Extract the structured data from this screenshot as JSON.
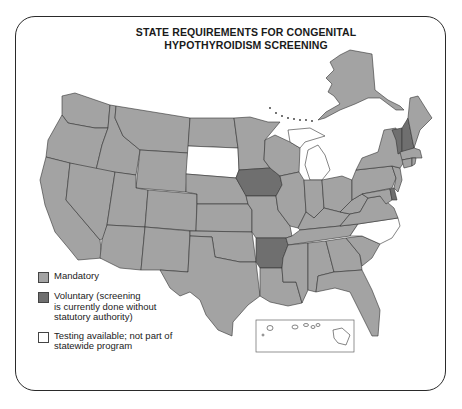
{
  "title": {
    "line1": "STATE REQUIREMENTS FOR CONGENITAL",
    "line2": "HYPOTHYROIDISM SCREENING"
  },
  "colors": {
    "mandatory": "#a3a3a3",
    "voluntary": "#6f6f6f",
    "testing_available": "#ffffff",
    "border": "#2a2a2a"
  },
  "legend": {
    "items": [
      {
        "key": "mandatory",
        "label": "Mandatory"
      },
      {
        "key": "voluntary",
        "label": "Voluntary (screening\nis currently done without\nstatutory authority)"
      },
      {
        "key": "testing_available",
        "label": "Testing available; not part of\nstatewide program"
      }
    ]
  },
  "states": {
    "voluntary": [
      "Iowa",
      "Arkansas",
      "Vermont",
      "New Hampshire",
      "Delaware"
    ],
    "testing_available": [
      "South Dakota",
      "Michigan",
      "North Carolina",
      "Hawaii"
    ],
    "mandatory": "all other states including Alaska"
  },
  "insets": {
    "alaska": "upper right",
    "hawaii": "lower center box"
  }
}
